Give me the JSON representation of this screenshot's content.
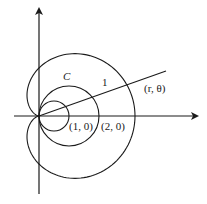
{
  "diagram": {
    "type": "polar-curve",
    "labels": {
      "curve": "C",
      "segment": "1",
      "point_polar": "(r, θ)",
      "point_1": "(1, 0)",
      "point_2": "(2, 0)"
    },
    "colors": {
      "stroke": "#1a1a1a",
      "background": "#ffffff"
    }
  }
}
